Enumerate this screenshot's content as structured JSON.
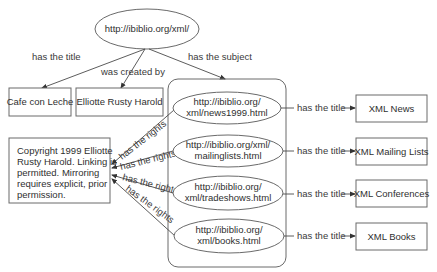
{
  "diagram": {
    "root": {
      "label": "http://ibiblio.org/xml/"
    },
    "root_edges": {
      "title": "has the title",
      "creator": "was created by",
      "subject": "has the subject"
    },
    "title_node": {
      "label": "Cafe con Leche"
    },
    "creator_node": {
      "label": "Elliotte Rusty Harold"
    },
    "rights_node": {
      "lines": [
        "Copyright 1999 Elliotte",
        "Rusty Harold.  Linking is",
        "permitted.  Mirroring",
        "requires explicit, prior",
        "permission."
      ]
    },
    "rights_edge_label": "has the rights",
    "title_edge_label": "has the title",
    "subjects": [
      {
        "line1": "http://ibiblio.org/",
        "line2": "xml/news1999.html",
        "title": "XML News"
      },
      {
        "line1": "http://ibiblio.org/xml/",
        "line2": "mailinglists.html",
        "title": "XML Mailing Lists"
      },
      {
        "line1": "http://ibiblio.org/",
        "line2": "xml/tradeshows.html",
        "title": "XML Conferences"
      },
      {
        "line1": "http://ibiblio.org/",
        "line2": "xml/books.html",
        "title": "XML Books"
      }
    ]
  }
}
